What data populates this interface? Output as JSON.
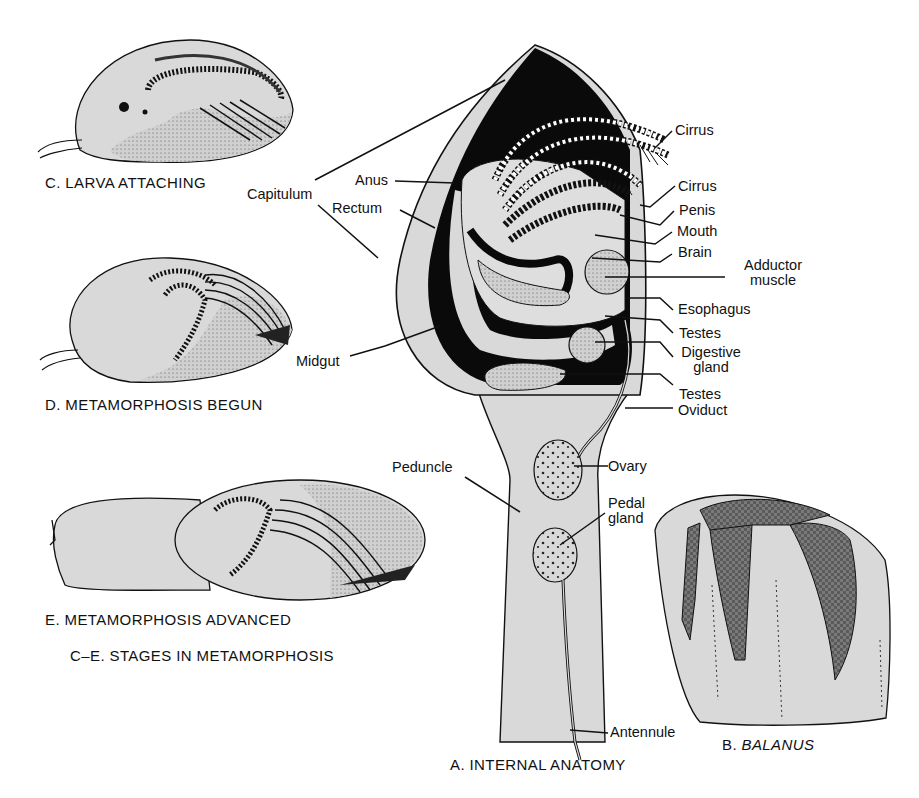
{
  "figure": {
    "panels": {
      "A": {
        "caption": "A. INTERNAL ANATOMY"
      },
      "B": {
        "caption_prefix": "B. ",
        "caption_italic": "BALANUS"
      },
      "C": {
        "caption": "C. LARVA ATTACHING"
      },
      "D": {
        "caption": "D. METAMORPHOSIS BEGUN"
      },
      "E": {
        "caption": "E. METAMORPHOSIS ADVANCED"
      },
      "CE": {
        "caption": "C–E. STAGES IN METAMORPHOSIS"
      }
    },
    "labels": {
      "capitulum": "Capitulum",
      "anus": "Anus",
      "rectum": "Rectum",
      "midgut": "Midgut",
      "peduncle": "Peduncle",
      "cirrus_1": "Cirrus",
      "cirrus_2": "Cirrus",
      "penis": "Penis",
      "mouth": "Mouth",
      "brain": "Brain",
      "adductor_1": "Adductor",
      "adductor_2": "muscle",
      "esophagus": "Esophagus",
      "testes_1": "Testes",
      "digestive_1": "Digestive",
      "digestive_2": "gland",
      "testes_2": "Testes",
      "oviduct": "Oviduct",
      "ovary": "Ovary",
      "pedal_1": "Pedal",
      "pedal_2": "gland",
      "antennule": "Antennule"
    },
    "colors": {
      "body_fill": "#d9d9d9",
      "black": "#0a0a0a",
      "plate_dark": "#6e6e6e",
      "line": "#111111"
    }
  }
}
